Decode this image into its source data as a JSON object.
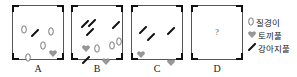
{
  "boxes": [
    {
      "label": "A",
      "items": [
        {
          "type": "oval",
          "x": 8,
          "y": 14
        },
        {
          "type": "slash",
          "x": 18,
          "y": 17
        },
        {
          "type": "oval",
          "x": 35,
          "y": 16
        },
        {
          "type": "oval",
          "x": 27,
          "y": 30
        },
        {
          "type": "heart",
          "x": 36,
          "y": 37
        },
        {
          "type": "oval",
          "x": 12,
          "y": 42
        }
      ]
    },
    {
      "label": "B",
      "items": [
        {
          "type": "slash",
          "x": 9,
          "y": 8
        },
        {
          "type": "slash",
          "x": 16,
          "y": 7
        },
        {
          "type": "slash",
          "x": 14,
          "y": 16
        },
        {
          "type": "slash",
          "x": 40,
          "y": 9
        },
        {
          "type": "heart",
          "x": 10,
          "y": 32
        },
        {
          "type": "oval",
          "x": 22,
          "y": 33
        },
        {
          "type": "oval",
          "x": 37,
          "y": 30
        },
        {
          "type": "oval",
          "x": 44,
          "y": 26
        },
        {
          "type": "slash",
          "x": 10,
          "y": 44
        },
        {
          "type": "heart",
          "x": 30,
          "y": 45
        }
      ]
    },
    {
      "label": "C",
      "items": [
        {
          "type": "slash",
          "x": 7,
          "y": 14
        },
        {
          "type": "slash",
          "x": 15,
          "y": 21
        },
        {
          "type": "slash",
          "x": 35,
          "y": 15
        },
        {
          "type": "heart",
          "x": 5,
          "y": 38
        },
        {
          "type": "heart",
          "x": 35,
          "y": 46
        }
      ]
    },
    {
      "label": "D",
      "question": "?",
      "items": []
    }
  ],
  "legend": [
    {
      "type": "oval",
      "label": "질경이"
    },
    {
      "type": "heart",
      "label": "토끼풀"
    },
    {
      "type": "slash",
      "label": "강아지풀"
    }
  ]
}
